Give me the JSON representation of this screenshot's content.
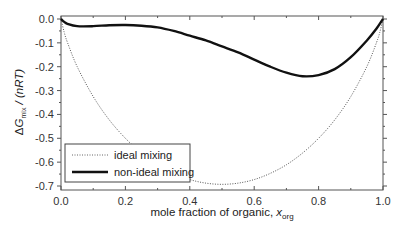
{
  "chart_data": {
    "type": "line",
    "title": "",
    "xlabel": "mole fraction of organic, x_org",
    "xlabel_main": "mole fraction of organic, ",
    "xlabel_var": "x",
    "xlabel_sub": "org",
    "ylabel": "ΔG_mix / (nRT)",
    "ylabel_parts": {
      "delta": "Δ",
      "var": "G",
      "sub": "mix",
      "rest": " / (nRT)"
    },
    "xlim": [
      0.0,
      1.0
    ],
    "ylim": [
      -0.7,
      0.0
    ],
    "xticks": [
      "0.0",
      "0.2",
      "0.4",
      "0.6",
      "0.8",
      "1.0"
    ],
    "yticks": [
      "0.0",
      "-0.1",
      "-0.2",
      "-0.3",
      "-0.4",
      "-0.5",
      "-0.6",
      "-0.7"
    ],
    "grid": false,
    "legend_position": "lower left",
    "series": [
      {
        "name": "ideal mixing",
        "style": "dotted",
        "color": "#555555",
        "x": [
          0,
          0.01,
          0.02,
          0.05,
          0.1,
          0.15,
          0.2,
          0.25,
          0.3,
          0.35,
          0.4,
          0.45,
          0.5,
          0.55,
          0.6,
          0.65,
          0.7,
          0.75,
          0.8,
          0.85,
          0.9,
          0.95,
          0.98,
          0.99,
          1.0
        ],
        "y": [
          0,
          -0.056,
          -0.098,
          -0.199,
          -0.325,
          -0.423,
          -0.5,
          -0.562,
          -0.611,
          -0.647,
          -0.673,
          -0.688,
          -0.693,
          -0.688,
          -0.673,
          -0.647,
          -0.611,
          -0.562,
          -0.5,
          -0.423,
          -0.325,
          -0.199,
          -0.098,
          -0.056,
          0
        ]
      },
      {
        "name": "non-ideal mixing",
        "style": "solid",
        "color": "#111111",
        "x": [
          0,
          0.01,
          0.02,
          0.05,
          0.1,
          0.15,
          0.2,
          0.25,
          0.3,
          0.35,
          0.4,
          0.45,
          0.5,
          0.55,
          0.6,
          0.65,
          0.7,
          0.75,
          0.8,
          0.85,
          0.9,
          0.95,
          0.98,
          1.0
        ],
        "y": [
          0,
          -0.012,
          -0.02,
          -0.03,
          -0.03,
          -0.026,
          -0.025,
          -0.028,
          -0.035,
          -0.05,
          -0.07,
          -0.09,
          -0.115,
          -0.14,
          -0.17,
          -0.2,
          -0.225,
          -0.24,
          -0.235,
          -0.21,
          -0.16,
          -0.09,
          -0.04,
          0
        ]
      }
    ]
  },
  "legend": {
    "items": [
      {
        "label": "ideal mixing"
      },
      {
        "label": "non-ideal mixing"
      }
    ]
  }
}
